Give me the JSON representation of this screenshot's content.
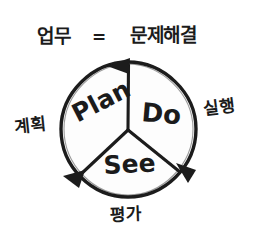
{
  "diagram": {
    "title_equation": {
      "left_term": "업무",
      "operator": "=",
      "right_term": "문제해결"
    },
    "cycle_name": "Plan-Do-See",
    "ink_color": "#1b1b1b",
    "background_color": "#ffffff",
    "sectors": [
      {
        "english": "Plan",
        "korean": "계획"
      },
      {
        "english": "Do",
        "korean": "실행"
      },
      {
        "english": "See",
        "korean": "평가"
      }
    ],
    "arrows": [
      {
        "name": "arrow-top",
        "direction": "counterclockwise"
      },
      {
        "name": "arrow-lower-right",
        "direction": "counterclockwise"
      },
      {
        "name": "arrow-lower-left",
        "direction": "counterclockwise"
      }
    ]
  }
}
